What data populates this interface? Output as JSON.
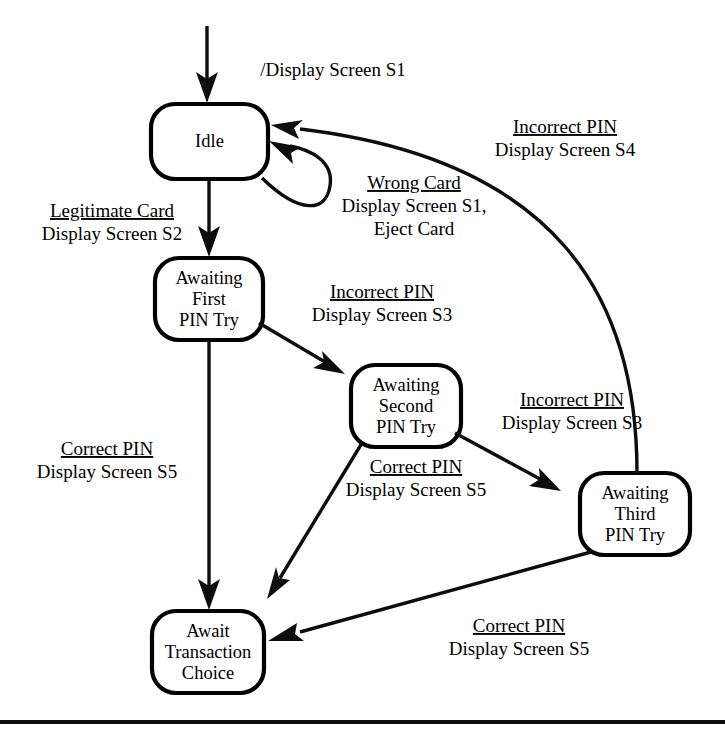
{
  "diagram": {
    "type": "state-machine",
    "initial_transition": {
      "action": "/Display Screen S1"
    },
    "states": [
      {
        "id": "idle",
        "label_lines": [
          "Idle"
        ]
      },
      {
        "id": "first_pin",
        "label_lines": [
          "Awaiting",
          "First",
          "PIN Try"
        ]
      },
      {
        "id": "second_pin",
        "label_lines": [
          "Awaiting",
          "Second",
          "PIN Try"
        ]
      },
      {
        "id": "third_pin",
        "label_lines": [
          "Awaiting",
          "Third",
          "PIN Try"
        ]
      },
      {
        "id": "await_txn",
        "label_lines": [
          "Await",
          "Transaction",
          "Choice"
        ]
      }
    ],
    "transitions": [
      {
        "id": "t_idle_self",
        "from": "idle",
        "to": "idle",
        "trigger": "Wrong Card",
        "actions": [
          "Display Screen S1,",
          "Eject Card"
        ]
      },
      {
        "id": "t_idle_first",
        "from": "idle",
        "to": "first_pin",
        "trigger": "Legitimate Card",
        "actions": [
          "Display Screen S2"
        ]
      },
      {
        "id": "t_first_second",
        "from": "first_pin",
        "to": "second_pin",
        "trigger": "Incorrect PIN",
        "actions": [
          "Display Screen S3"
        ]
      },
      {
        "id": "t_second_third",
        "from": "second_pin",
        "to": "third_pin",
        "trigger": "Incorrect PIN",
        "actions": [
          "Display Screen S3"
        ]
      },
      {
        "id": "t_third_idle",
        "from": "third_pin",
        "to": "idle",
        "trigger": "Incorrect PIN",
        "actions": [
          "Display Screen S4"
        ]
      },
      {
        "id": "t_first_await",
        "from": "first_pin",
        "to": "await_txn",
        "trigger": "Correct PIN",
        "actions": [
          "Display Screen S5"
        ]
      },
      {
        "id": "t_second_await",
        "from": "second_pin",
        "to": "await_txn",
        "trigger": "Correct PIN",
        "actions": [
          "Display Screen S5"
        ]
      },
      {
        "id": "t_third_await",
        "from": "third_pin",
        "to": "await_txn",
        "trigger": "Correct PIN",
        "actions": [
          "Display Screen S5"
        ]
      }
    ],
    "colors": {
      "stroke": "#0d0d0d",
      "fill": "#ffffff",
      "text": "#000000"
    }
  }
}
